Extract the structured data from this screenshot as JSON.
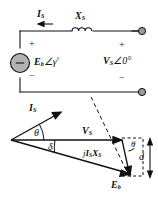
{
  "figure": {
    "kind": "circuit-and-phasor-diagram",
    "ink_color": "#111111",
    "node_fill": "#9a9a9a",
    "source_fill": "#b3b3b3"
  },
  "circuit": {
    "current_label": "I",
    "current_sub": "S",
    "reactance_label": "X",
    "reactance_sub": "S",
    "source_label": "E",
    "source_sub": "b",
    "source_angle": "∠γ",
    "source_angle_sup": "°",
    "source_inner_sign": "−",
    "source_plus": "+",
    "source_minus": "−",
    "terminal_plus": "+",
    "terminal_minus": "−",
    "terminal_voltage": "V",
    "terminal_voltage_sub": "S",
    "terminal_voltage_angle": "∠0°"
  },
  "phasor": {
    "current_label": "I",
    "current_sub": "S",
    "voltage_label": "V",
    "voltage_sub": "S",
    "emf_label": "E",
    "emf_sub": "b",
    "drop_label": "j",
    "drop_current": "I",
    "drop_current_sub": "S",
    "drop_reactance": "X",
    "drop_reactance_sub": "S",
    "theta_origin": "θ",
    "theta_corner": "θ",
    "delta": "δ",
    "distance": "d"
  }
}
